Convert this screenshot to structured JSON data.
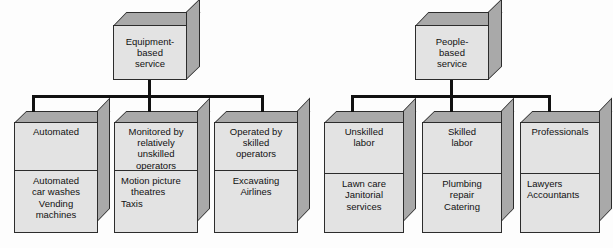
{
  "diagram": {
    "colors": {
      "box_front": "#e3e3e3",
      "box_side": "#a9a9a9",
      "outline": "#2c2c2c",
      "connector": "#111111",
      "background": "#fdfdfd"
    },
    "groups": [
      {
        "id": "equipment-based",
        "root": {
          "lines": [
            "Equipment-",
            "based",
            "service"
          ]
        },
        "children": [
          {
            "id": "automated",
            "header_lines": [
              "Automated"
            ],
            "example_lines": [
              "Automated",
              "car washes",
              "Vending",
              "machines"
            ]
          },
          {
            "id": "monitored-by-relatively-unskilled-operators",
            "header_lines": [
              "Monitored by",
              "relatively",
              "unskilled",
              "operators"
            ],
            "example_lines": [
              "Motion picture",
              "theatres",
              "Taxis"
            ]
          },
          {
            "id": "operated-by-skilled-operators",
            "header_lines": [
              "Operated by",
              "skilled",
              "operators"
            ],
            "example_lines": [
              "Excavating",
              "Airlines"
            ]
          }
        ]
      },
      {
        "id": "people-based",
        "root": {
          "lines": [
            "People-",
            "based",
            "service"
          ]
        },
        "children": [
          {
            "id": "unskilled-labor",
            "header_lines": [
              "Unskilled",
              "labor"
            ],
            "example_lines": [
              "Lawn care",
              "Janitorial",
              "services"
            ]
          },
          {
            "id": "skilled-labor",
            "header_lines": [
              "Skilled",
              "labor"
            ],
            "example_lines": [
              "Plumbing",
              "repair",
              "Catering"
            ]
          },
          {
            "id": "professionals",
            "header_lines": [
              "Professionals"
            ],
            "example_lines": [
              "Lawyers",
              "Accountants"
            ]
          }
        ]
      }
    ]
  }
}
